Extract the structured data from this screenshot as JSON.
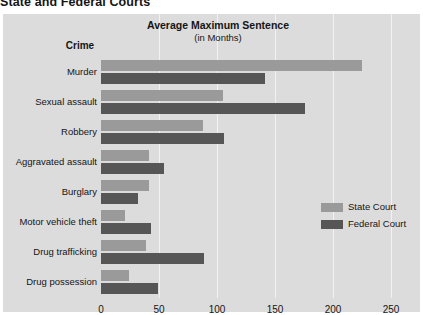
{
  "title": "State and Federal Courts",
  "headers": {
    "category_column": "Crime",
    "value_column_line1": "Average Maximum Sentence",
    "value_column_line2": "(in Months)"
  },
  "legend": {
    "state_label": "State Court",
    "federal_label": "Federal Court",
    "state_color": "#9a9a9a",
    "federal_color": "#565656",
    "position": "right-middle"
  },
  "panel_color": "#dcdcdc",
  "gridline_color": "#f2f2f2",
  "chart_data": {
    "type": "bar",
    "orientation": "horizontal",
    "title": "State and Federal Courts",
    "subtitle": "Average Maximum Sentence (in Months)",
    "xlabel": "",
    "ylabel": "Crime",
    "xlim": [
      0,
      275
    ],
    "grid": true,
    "xticks": [
      0,
      50,
      100,
      150,
      200,
      250
    ],
    "xtick_labels": [
      "0",
      "50",
      "100",
      "150",
      "200",
      "250"
    ],
    "categories": [
      "Murder",
      "Sexual assault",
      "Robbery",
      "Aggravated assault",
      "Burglary",
      "Motor vehicle theft",
      "Drug trafficking",
      "Drug possession"
    ],
    "series": [
      {
        "name": "State Court",
        "color": "#9a9a9a",
        "values": [
          225,
          105,
          88,
          41,
          41,
          21,
          39,
          24
        ]
      },
      {
        "name": "Federal Court",
        "color": "#565656",
        "values": [
          141,
          176,
          106,
          54,
          32,
          43,
          89,
          49
        ]
      }
    ]
  }
}
